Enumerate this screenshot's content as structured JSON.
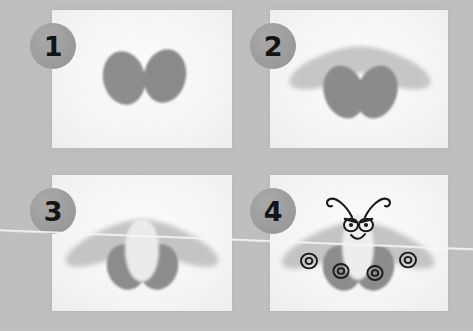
{
  "image": {
    "title": "Four-step thumbprint moth craft tutorial",
    "subject": "moth",
    "width": 473,
    "height": 331,
    "palette": {
      "backdrop": "#bfbfbf",
      "card": "#f7f7f7",
      "badge_fill": "#9d9d9d",
      "badge_text": "#141414",
      "ink_dark": "#8a8a8a",
      "ink_light": "#c3c3c3",
      "ink_body": "#e3e3e3",
      "outline": "#1a1a1a"
    },
    "is_grayscale": true,
    "artifact": "thin white diagonal scratch line crossing the lower third of the photo"
  },
  "steps": [
    {
      "number": "1",
      "badge_label": "1",
      "caption": "Two dark oval thumbprints placed side by side forming the hindwings",
      "elements": [
        "left-hindwing",
        "right-hindwing"
      ]
    },
    {
      "number": "2",
      "badge_label": "2",
      "caption": "Two long light-gray prints angled outward above the dark ovals to form the forewings",
      "elements": [
        "left-hindwing",
        "right-hindwing",
        "left-forewing",
        "right-forewing"
      ]
    },
    {
      "number": "3",
      "badge_label": "3",
      "caption": "A pale vertical oval stamped in the centre to make the moth body",
      "elements": [
        "left-hindwing",
        "right-hindwing",
        "left-forewing",
        "right-forewing",
        "body"
      ]
    },
    {
      "number": "4",
      "badge_label": "4",
      "caption": "Drawn-on face with eyes, smile, curling antennae and four ringed wing spots",
      "elements": [
        "left-hindwing",
        "right-hindwing",
        "left-forewing",
        "right-forewing",
        "body",
        "eyes",
        "smile",
        "antennae",
        "wing-spots"
      ]
    }
  ],
  "panels": [
    {
      "x": 52,
      "y": 10,
      "w": 180,
      "h": 138,
      "badge_x": 30,
      "badge_y": 23
    },
    {
      "x": 270,
      "y": 10,
      "w": 178,
      "h": 138,
      "badge_x": 250,
      "badge_y": 23
    },
    {
      "x": 52,
      "y": 175,
      "w": 180,
      "h": 136,
      "badge_x": 30,
      "badge_y": 188
    },
    {
      "x": 270,
      "y": 175,
      "w": 178,
      "h": 136,
      "badge_x": 250,
      "badge_y": 188
    }
  ],
  "annotations": {
    "wing_spot_count": 4,
    "antenna_count": 2,
    "eye_count": 2
  }
}
